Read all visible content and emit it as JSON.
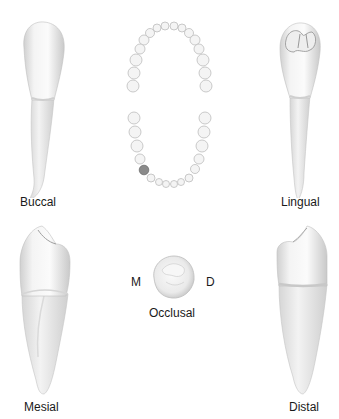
{
  "figure": {
    "views": {
      "buccal": {
        "label": "Buccal"
      },
      "lingual": {
        "label": "Lingual"
      },
      "mesial": {
        "label": "Mesial"
      },
      "distal": {
        "label": "Distal"
      },
      "occlusal": {
        "label": "Occlusal",
        "left_marker": "M",
        "right_marker": "D"
      }
    },
    "arch": {
      "highlighted_tooth": "mandibular left first premolar"
    },
    "colors": {
      "tooth_fill": "#f2f2f2",
      "tooth_shadow": "#c8c8c8",
      "outline": "#b5b5b5",
      "highlight": "#8a8a8a"
    }
  }
}
